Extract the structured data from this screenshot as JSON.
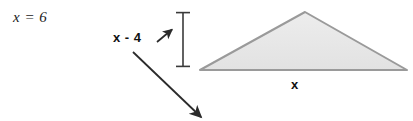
{
  "figure": {
    "width": 413,
    "height": 121,
    "background": "#ffffff"
  },
  "labels": {
    "equation": "x = 6",
    "height": "x - 4",
    "base": "x"
  },
  "icons": {
    "height_pointer": "up-right-arrow-icon",
    "callout_pointer": "down-right-arrow-icon",
    "dimension_bar": "vertical-dimension-line-icon"
  },
  "colors": {
    "text": "#1a1a1a",
    "triangle_fill": "#e8e8e8",
    "triangle_stroke": "#9a9a9a",
    "arrow": "#2b2b2b",
    "dimension_line": "#3a3a3a"
  },
  "shapes": {
    "triangle": {
      "name": "shaded-triangle",
      "points": "200,70 305,12 407,70",
      "fill": "#e8e8e8",
      "stroke": "#9a9a9a",
      "stroke_width": 2
    },
    "dimension_bar": {
      "name": "height-dimension-bar",
      "x": 183,
      "y_top": 12,
      "y_bottom": 67,
      "cap_half_width": 7
    },
    "height_arrow": {
      "name": "height-arrow",
      "x1": 157,
      "y1": 42,
      "x2": 173,
      "y2": 29
    },
    "callout_arrow": {
      "name": "callout-arrow",
      "x1": 133,
      "y1": 52,
      "x2": 202,
      "y2": 118
    }
  }
}
